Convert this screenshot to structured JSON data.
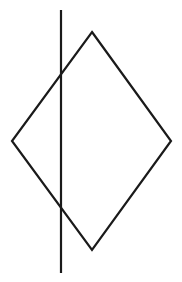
{
  "figure": {
    "width": 182,
    "height": 282,
    "background": "#ffffff",
    "stroke_color": "#1a1a1a",
    "stroke_width": 2.2,
    "shapes": {
      "diamond": {
        "type": "rhombus",
        "vertices": {
          "top": [
            92,
            32
          ],
          "right": [
            171,
            141
          ],
          "bottom": [
            92,
            250
          ],
          "left": [
            12,
            141
          ]
        }
      },
      "vertical_line": {
        "type": "line",
        "x": 61,
        "y1": 10,
        "y2": 273
      }
    }
  }
}
